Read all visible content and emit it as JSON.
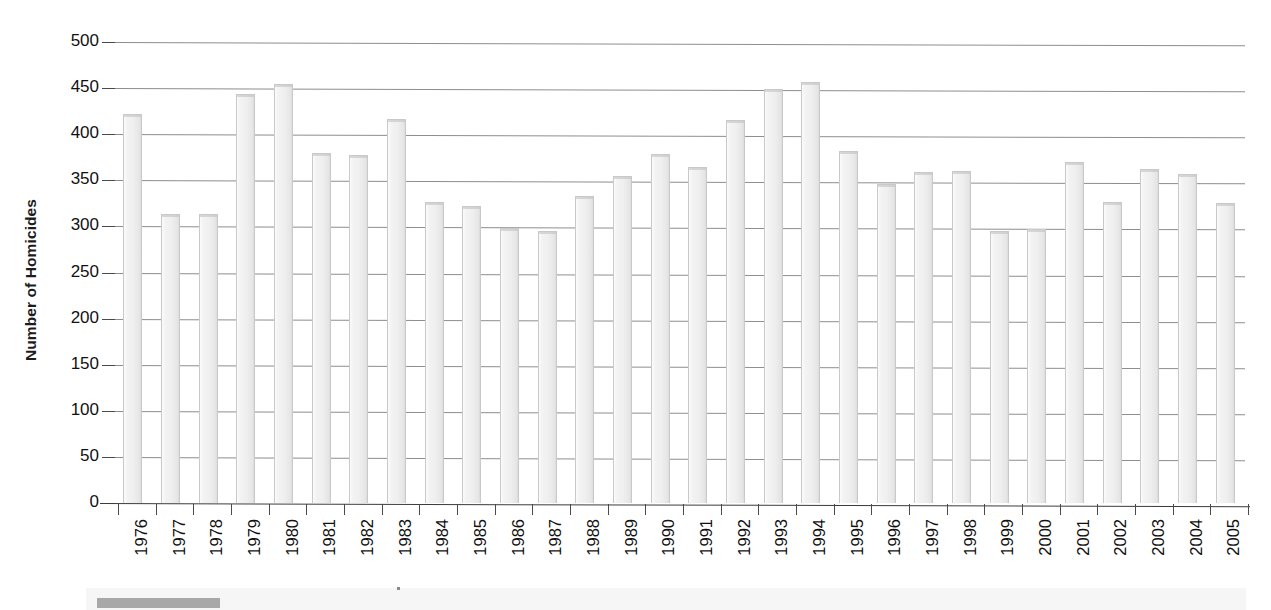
{
  "chart_data": {
    "type": "bar",
    "title": "",
    "xlabel": "",
    "ylabel": "Number of Homicides",
    "ylim": [
      0,
      500
    ],
    "ytick_step": 50,
    "yticks": [
      500,
      450,
      400,
      350,
      300,
      250,
      200,
      150,
      100,
      50,
      0
    ],
    "grid": true,
    "legend": "none",
    "categories": [
      "1976",
      "1977",
      "1978",
      "1979",
      "1980",
      "1981",
      "1982",
      "1983",
      "1984",
      "1985",
      "1986",
      "1987",
      "1988",
      "1989",
      "1990",
      "1991",
      "1992",
      "1993",
      "1994",
      "1995",
      "1996",
      "1997",
      "1998",
      "1999",
      "2000",
      "2001",
      "2002",
      "2003",
      "2004",
      "2005"
    ],
    "values": [
      422,
      313,
      313,
      444,
      455,
      380,
      377,
      416,
      326,
      322,
      298,
      295,
      333,
      355,
      379,
      364,
      415,
      449,
      457,
      382,
      346,
      359,
      360,
      295,
      297,
      370,
      327,
      362,
      357,
      325
    ]
  },
  "colors": {
    "bar_fill": "#efefef",
    "bar_edge": "#c9c9c9",
    "gridline": "#6e6e6e",
    "axis": "#3c3c3c",
    "text": "#111111",
    "background": "#ffffff"
  }
}
